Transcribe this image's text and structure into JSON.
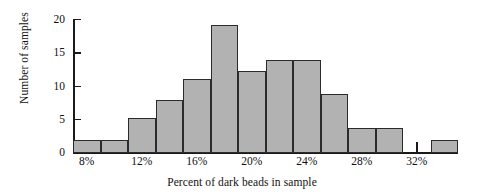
{
  "chart_data": {
    "type": "bar",
    "title": "",
    "subtitle": "",
    "xlabel": "Percent of dark beads in sample",
    "ylabel": "Number of samples",
    "grid": false,
    "legend": false,
    "ylim": [
      0,
      20
    ],
    "yticks": [
      0,
      5,
      10,
      15,
      20
    ],
    "ytick_labels": [
      "0",
      "5",
      "10",
      "15",
      "20"
    ],
    "xlim": [
      6,
      34
    ],
    "bin_width": 2,
    "xticks": [
      7,
      9,
      11,
      13,
      15,
      17,
      19,
      21,
      23,
      25,
      27,
      29,
      31,
      33
    ],
    "xtick_labels": [
      "8%",
      "",
      "12%",
      "",
      "16%",
      "",
      "20%",
      "",
      "24%",
      "",
      "28%",
      "",
      "32%",
      ""
    ],
    "labeled_xticks": [
      {
        "value": 7,
        "label": "8%"
      },
      {
        "value": 11,
        "label": "12%"
      },
      {
        "value": 15,
        "label": "16%"
      },
      {
        "value": 19,
        "label": "20%"
      },
      {
        "value": 23,
        "label": "24%"
      },
      {
        "value": 27,
        "label": "28%"
      },
      {
        "value": 31,
        "label": "32%"
      }
    ],
    "categories": [
      "6-8",
      "8-10",
      "10-12",
      "12-14",
      "14-16",
      "16-18",
      "18-20",
      "20-22",
      "22-24",
      "24-26",
      "26-28",
      "28-30",
      "30-32",
      "32-34"
    ],
    "bin_starts": [
      6,
      8,
      10,
      12,
      14,
      16,
      18,
      20,
      22,
      24,
      26,
      28,
      30,
      32
    ],
    "values": [
      2,
      2,
      5.2,
      8,
      11.2,
      19.3,
      12.4,
      14,
      14,
      8.8,
      3.8,
      3.8,
      0,
      2
    ],
    "bar_color": "#b2b2b2",
    "bar_edge_color": "#2b2b2b",
    "axis_color": "#1a1a1a",
    "background": "#ffffff"
  }
}
